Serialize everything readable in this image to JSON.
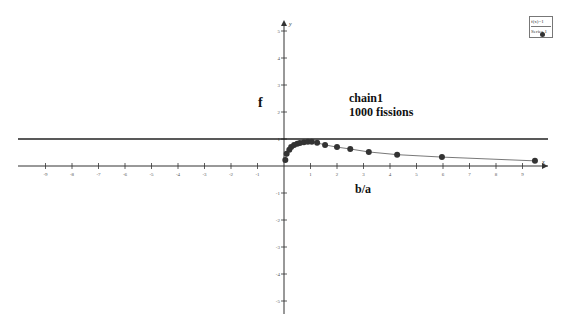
{
  "chart_data": {
    "type": "scatter",
    "title": "chain1\n1000 fissions",
    "title_lines": [
      "chain1",
      "1000 fissions"
    ],
    "xlabel": "b/a",
    "ylabel": "f",
    "x_axis_name": "x",
    "y_axis_name": "y",
    "xlim": [
      -10,
      10
    ],
    "ylim": [
      -5.5,
      5.5
    ],
    "x_ticks": [
      -9,
      -8,
      -7,
      -6,
      -5,
      -4,
      -3,
      -2,
      -1,
      1,
      2,
      3,
      4,
      5,
      6,
      7,
      8,
      9
    ],
    "y_ticks": [
      -5,
      -4,
      -3,
      -2,
      -1,
      1,
      2,
      3,
      4,
      5
    ],
    "grid": false,
    "legend_position": "top-right",
    "reference_lines": [
      {
        "name": "f(x)=1",
        "type": "horizontal",
        "y": 1
      }
    ],
    "series": [
      {
        "name": "Series 1",
        "marker": "circle",
        "connected": true,
        "color": "#333333",
        "x": [
          0.05,
          0.1,
          0.2,
          0.27,
          0.38,
          0.5,
          0.6,
          0.75,
          0.9,
          1.05,
          1.25,
          1.55,
          2.0,
          2.5,
          3.2,
          4.27,
          5.96,
          9.47
        ],
        "y": [
          0.22,
          0.45,
          0.6,
          0.7,
          0.78,
          0.82,
          0.85,
          0.88,
          0.9,
          0.9,
          0.86,
          0.78,
          0.7,
          0.63,
          0.52,
          0.42,
          0.33,
          0.19
        ]
      }
    ]
  },
  "legend": {
    "items": [
      "f(x)=1",
      "Series 1"
    ]
  },
  "labels": {
    "ylabel": "f",
    "title_line1": "chain1",
    "title_line2": "1000 fissions",
    "xlabel": "b/a"
  },
  "colors": {
    "axis": "#333333",
    "reference_line": "#222222",
    "series": "#333333"
  }
}
